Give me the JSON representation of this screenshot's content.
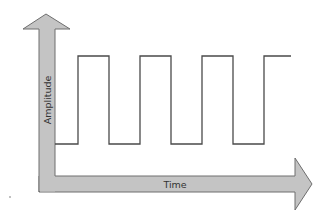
{
  "diagram": {
    "y_axis": {
      "label": "Amplitude"
    },
    "x_axis": {
      "label": "Time"
    },
    "waveform": {
      "type": "square-wave",
      "high_level_px": 56,
      "low_level_px": 144,
      "edges_x_px": [
        78,
        109,
        140,
        171,
        202,
        233,
        264
      ],
      "start_x_px": 55,
      "end_x_px": 291,
      "cycles_high": 4
    },
    "colors": {
      "axis_fill": "#c4c4c4",
      "axis_stroke": "#6e6e6e",
      "waveform_stroke": "#4a4a4a",
      "label_text": "#333333",
      "background": "#ffffff"
    }
  }
}
